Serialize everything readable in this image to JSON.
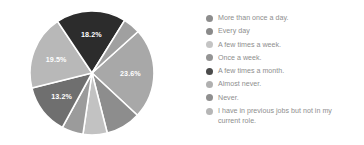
{
  "chart_data": {
    "type": "pie",
    "title": "",
    "subtitle": "",
    "xlabel": "",
    "ylabel": "",
    "grid": false,
    "legend_position": "right",
    "categories": [
      "More than once a day.",
      "Every day",
      "A few times a week.",
      "Once a week.",
      "A few times a month.",
      "Almost never.",
      "Never.",
      "I have in previous jobs but not in my current role."
    ],
    "values": [
      23.6,
      9.1,
      6.3,
      5.6,
      13.2,
      19.5,
      18.2,
      4.5
    ],
    "value_unit": "%",
    "data_labels": [
      "23.6%",
      "",
      "",
      "",
      "13.2%",
      "19.5%",
      "18.2%",
      ""
    ],
    "data_labels_shown": [
      "23.6%",
      "13.2%",
      "19.5%",
      "18.2%"
    ],
    "slice_colors": [
      "#a8a8a8",
      "#8d8d8d",
      "#c2c2c2",
      "#9b9b9b",
      "#6f6f6f",
      "#b8b8b8",
      "#2c2c2c",
      "#a0a0a0"
    ],
    "start_angle_deg": -42,
    "direction": "clockwise",
    "stroke_color": "#ffffff"
  },
  "legend": {
    "items": [
      {
        "label": "More than once a day.",
        "color": "#8d8d8d"
      },
      {
        "label": "Every day",
        "color": "#8a8a8a"
      },
      {
        "label": "A few times a week.",
        "color": "#c4c4c4"
      },
      {
        "label": "Once a week.",
        "color": "#949494"
      },
      {
        "label": "A few times a month.",
        "color": "#4b4b4b"
      },
      {
        "label": "Almost never.",
        "color": "#b0b0b0"
      },
      {
        "label": "Never.",
        "color": "#8f8f8f"
      },
      {
        "label": "I have in previous jobs but not in my\ncurrent role.",
        "color": "#b6b6b6"
      }
    ],
    "text_color": "#8e8e8e"
  }
}
